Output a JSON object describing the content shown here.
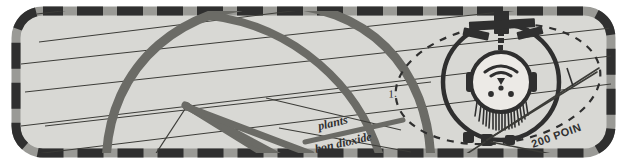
{
  "canvas": {
    "width": 627,
    "height": 166,
    "outer_background": "#ffffff"
  },
  "panel": {
    "name": "diagram-panel",
    "shape": "rounded-rectangle",
    "fill": "#d8d8d4",
    "corner_radius": 30,
    "border": {
      "style": "dashed",
      "dash_dark_color": "#2f2f2f",
      "dash_light_color": "#9a9a96",
      "width": 9,
      "dash_length": 26,
      "gap_length": 14
    }
  },
  "colors": {
    "thick_stroke": "#6b6b66",
    "thin_stroke": "#3c3c38",
    "dark_ink": "#2f2f2f",
    "panel_fill": "#d8d8d4",
    "paper_white": "#ffffff"
  },
  "annotations": {
    "label_plants": "plants",
    "label_carbon_dioxide": "bon dioxide",
    "label_points": "200 POIN",
    "label_step_one": "1."
  },
  "graphic": {
    "dome_arc": "large-thick-semicircular-arc",
    "hatch_lines_count": 7,
    "wedge_lines": "angular-thick-wedge",
    "dashed_ellipse": "dashed-orbit-ellipse",
    "device": {
      "name": "circular-face-device",
      "outer_ring": "thick-circle",
      "head_circle": "inner-head-circle",
      "dot_count": 3,
      "brow_arc": "curved-arc-over-dots",
      "nose": "small-triangle",
      "beard_hatch_count": 22,
      "antenna": "top-mast-with-crossbars",
      "side_ears": 2,
      "bottom_nodes": 3
    }
  }
}
